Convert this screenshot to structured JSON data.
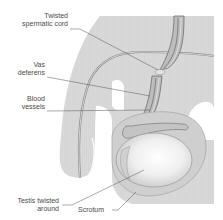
{
  "diagram": {
    "labels": [
      {
        "id": "twisted-spermatic-cord",
        "line1": "Twisted",
        "line2": "spermatic cord"
      },
      {
        "id": "vas-deferens",
        "line1": "Vas",
        "line2": "deferens"
      },
      {
        "id": "blood-vessels",
        "line1": "Blood",
        "line2": "vessels"
      },
      {
        "id": "testis-twisted-around",
        "line1": "Testis twisted",
        "line2": "around"
      },
      {
        "id": "scrotum",
        "line1": "Scrotum"
      }
    ],
    "colors": {
      "body": "#d8d8d8",
      "body_shade": "#cfcfcf",
      "outline": "#9a9a9a",
      "testis": "#e6e6e6",
      "testis_highlight": "#ffffff",
      "leader": "#555555",
      "text": "#4a4a4a"
    }
  }
}
